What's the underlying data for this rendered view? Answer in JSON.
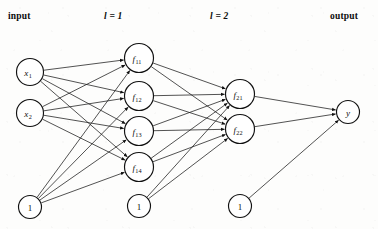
{
  "diagram": {
    "width": 378,
    "height": 229,
    "background_color": "#fdfdfc",
    "stroke_color": "#111111",
    "node_fill": "#ffffff"
  },
  "headers": [
    {
      "id": "input",
      "label": "input",
      "x": 8,
      "y": 11,
      "style": "bold"
    },
    {
      "id": "layer1",
      "label": "l = 1",
      "x": 104,
      "y": 11,
      "style": "bold-italic"
    },
    {
      "id": "layer2",
      "label": "l = 2",
      "x": 210,
      "y": 11,
      "style": "bold-italic"
    },
    {
      "id": "output",
      "label": "output",
      "x": 330,
      "y": 11,
      "style": "bold"
    }
  ],
  "layers": [
    {
      "id": "input-layer",
      "name": "input",
      "nodes": [
        {
          "id": "x1",
          "label": "x",
          "sub": "1",
          "cx": 30,
          "cy": 72,
          "r": 13.5,
          "kind": "input"
        },
        {
          "id": "x2",
          "label": "x",
          "sub": "2",
          "cx": 30,
          "cy": 113,
          "r": 13.5,
          "kind": "input"
        },
        {
          "id": "b0",
          "label": "1",
          "sub": "",
          "cx": 30,
          "cy": 207,
          "r": 11.5,
          "kind": "bias"
        }
      ]
    },
    {
      "id": "hidden-layer-1",
      "name": "l = 1",
      "nodes": [
        {
          "id": "f11",
          "label": "f",
          "sub": "11",
          "cx": 139,
          "cy": 58,
          "r": 14.5,
          "kind": "neuron"
        },
        {
          "id": "f12",
          "label": "f",
          "sub": "12",
          "cx": 139,
          "cy": 96,
          "r": 14.5,
          "kind": "neuron"
        },
        {
          "id": "f13",
          "label": "f",
          "sub": "13",
          "cx": 139,
          "cy": 131,
          "r": 14.5,
          "kind": "neuron"
        },
        {
          "id": "f14",
          "label": "f",
          "sub": "14",
          "cx": 139,
          "cy": 167,
          "r": 14.5,
          "kind": "neuron"
        },
        {
          "id": "b1",
          "label": "1",
          "sub": "",
          "cx": 139,
          "cy": 206,
          "r": 11.5,
          "kind": "bias"
        }
      ]
    },
    {
      "id": "hidden-layer-2",
      "name": "l = 2",
      "nodes": [
        {
          "id": "f21",
          "label": "f",
          "sub": "21",
          "cx": 240,
          "cy": 94,
          "r": 14.5,
          "kind": "neuron"
        },
        {
          "id": "f22",
          "label": "f",
          "sub": "22",
          "cx": 240,
          "cy": 129,
          "r": 14.5,
          "kind": "neuron"
        },
        {
          "id": "b2",
          "label": "1",
          "sub": "",
          "cx": 240,
          "cy": 206,
          "r": 11.5,
          "kind": "bias"
        }
      ]
    },
    {
      "id": "output-layer",
      "name": "output",
      "nodes": [
        {
          "id": "y",
          "label": "y",
          "sub": "",
          "cx": 348,
          "cy": 112,
          "r": 11.5,
          "kind": "output"
        }
      ]
    }
  ],
  "edges": [
    {
      "from": "x1",
      "to": "f11"
    },
    {
      "from": "x1",
      "to": "f12"
    },
    {
      "from": "x1",
      "to": "f13"
    },
    {
      "from": "x1",
      "to": "f14"
    },
    {
      "from": "x2",
      "to": "f11"
    },
    {
      "from": "x2",
      "to": "f12"
    },
    {
      "from": "x2",
      "to": "f13"
    },
    {
      "from": "x2",
      "to": "f14"
    },
    {
      "from": "b0",
      "to": "f11"
    },
    {
      "from": "b0",
      "to": "f12"
    },
    {
      "from": "b0",
      "to": "f13"
    },
    {
      "from": "b0",
      "to": "f14"
    },
    {
      "from": "f11",
      "to": "f21"
    },
    {
      "from": "f11",
      "to": "f22"
    },
    {
      "from": "f12",
      "to": "f21"
    },
    {
      "from": "f12",
      "to": "f22"
    },
    {
      "from": "f13",
      "to": "f21"
    },
    {
      "from": "f13",
      "to": "f22"
    },
    {
      "from": "f14",
      "to": "f21"
    },
    {
      "from": "f14",
      "to": "f22"
    },
    {
      "from": "b1",
      "to": "f21"
    },
    {
      "from": "b1",
      "to": "f22"
    },
    {
      "from": "f21",
      "to": "y"
    },
    {
      "from": "f22",
      "to": "y"
    },
    {
      "from": "b2",
      "to": "y"
    }
  ]
}
